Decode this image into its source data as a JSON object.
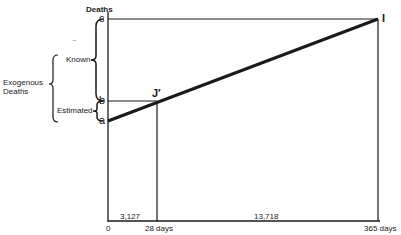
{
  "diagram": {
    "y_axis_label": "Deaths",
    "points": {
      "c": "c",
      "b": "b",
      "a": "a",
      "J": "J′",
      "I": "I"
    },
    "brackets": {
      "known": "Known",
      "estimated": "Estimated",
      "exogenous_line1": "Exogenous",
      "exogenous_line2": "Deaths"
    },
    "x_ticks": {
      "origin": "0",
      "t28": "28 days",
      "t365": "365 days"
    },
    "interval_values": {
      "first": "3,127",
      "second": "13,718"
    },
    "stray_mark": "~"
  }
}
